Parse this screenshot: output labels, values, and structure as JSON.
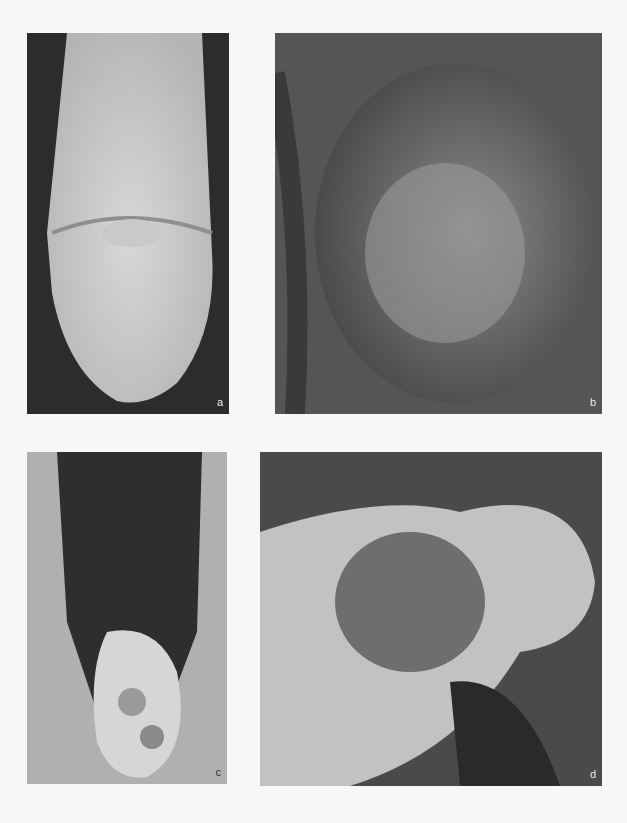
{
  "figure": {
    "panels": [
      {
        "id": "a",
        "label": "a",
        "description": "clinical photograph, panel a"
      },
      {
        "id": "b",
        "label": "b",
        "description": "clinical photograph, panel b"
      },
      {
        "id": "c",
        "label": "c",
        "description": "clinical photograph, panel c"
      },
      {
        "id": "d",
        "label": "d",
        "description": "clinical photograph, panel d"
      }
    ]
  }
}
